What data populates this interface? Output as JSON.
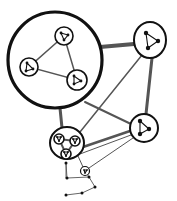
{
  "diagram": {
    "colors": {
      "ink": "#111111",
      "edge": "#555555",
      "background": "#ffffff"
    },
    "clusters": [
      {
        "id": "A",
        "label": "large-cluster",
        "cx": 55,
        "cy": 60,
        "rx": 47,
        "ry": 48,
        "stroke": 3.2,
        "children": [
          {
            "id": "A1",
            "cx": 64,
            "cy": 36,
            "r": 9
          },
          {
            "id": "A2",
            "cx": 29,
            "cy": 67,
            "r": 9
          },
          {
            "id": "A3",
            "cx": 77,
            "cy": 80,
            "r": 10
          }
        ]
      },
      {
        "id": "B",
        "label": "top-right-node",
        "cx": 150,
        "cy": 40,
        "rx": 16,
        "ry": 18,
        "stroke": 2
      },
      {
        "id": "C",
        "label": "right-node",
        "cx": 144,
        "cy": 128,
        "rx": 14,
        "ry": 14,
        "stroke": 2
      },
      {
        "id": "D",
        "label": "bottom-cluster",
        "cx": 67,
        "cy": 143,
        "rx": 17,
        "ry": 16,
        "stroke": 2,
        "children": [
          {
            "id": "D1",
            "cx": 59,
            "cy": 139,
            "r": 5
          },
          {
            "id": "D2",
            "cx": 75,
            "cy": 141,
            "r": 5
          },
          {
            "id": "D3",
            "cx": 66,
            "cy": 154,
            "r": 5
          }
        ]
      },
      {
        "id": "E",
        "label": "small-node",
        "cx": 85,
        "cy": 171,
        "rx": 4.5,
        "ry": 4.5,
        "stroke": 1.2
      }
    ],
    "edges": [
      {
        "from": "A",
        "to": "B",
        "x1": 100,
        "y1": 47,
        "x2": 134,
        "y2": 44,
        "width": 4
      },
      {
        "from": "A",
        "to": "C",
        "x1": 85,
        "y1": 102,
        "x2": 131,
        "y2": 124,
        "width": 2
      },
      {
        "from": "A",
        "to": "D",
        "x1": 60,
        "y1": 108,
        "x2": 62,
        "y2": 128,
        "width": 3
      },
      {
        "from": "B",
        "to": "C",
        "x1": 152,
        "y1": 58,
        "x2": 146,
        "y2": 114,
        "width": 3
      },
      {
        "from": "B",
        "to": "D",
        "x1": 142,
        "y1": 55,
        "x2": 80,
        "y2": 132,
        "width": 1.5
      },
      {
        "from": "C",
        "to": "D",
        "x1": 130,
        "y1": 131,
        "x2": 83,
        "y2": 147,
        "width": 2.5
      },
      {
        "from": "C",
        "to": "D",
        "x1": 131,
        "y1": 135,
        "x2": 80,
        "y2": 154,
        "width": 1
      },
      {
        "from": "C",
        "to": "E",
        "x1": 133,
        "y1": 138,
        "x2": 89,
        "y2": 168,
        "width": 1
      },
      {
        "from": "D",
        "to": "E",
        "x1": 78,
        "y1": 156,
        "x2": 83,
        "y2": 167,
        "width": 1
      }
    ],
    "polygon": {
      "points": [
        [
          66,
          163
        ],
        [
          67,
          178
        ],
        [
          89,
          177
        ],
        [
          95,
          187
        ],
        [
          82,
          193
        ],
        [
          66,
          195
        ]
      ],
      "extra_edges": [
        [
          [
            85,
            171
          ],
          [
            89,
            177
          ]
        ],
        [
          [
            66,
            178
          ],
          [
            66,
            163
          ]
        ]
      ]
    },
    "inner_motifs": {
      "A1": [
        [
          61,
          33
        ],
        [
          68,
          35
        ],
        [
          64,
          40
        ]
      ],
      "A2": [
        [
          27,
          63
        ],
        [
          26,
          71
        ],
        [
          33,
          69
        ]
      ],
      "A3": [
        [
          74,
          76
        ],
        [
          74,
          84
        ],
        [
          81,
          81
        ]
      ],
      "B": [
        [
          146,
          33
        ],
        [
          158,
          41
        ],
        [
          148,
          48
        ]
      ],
      "C": [
        [
          140,
          121
        ],
        [
          140,
          134
        ],
        [
          149,
          129
        ]
      ],
      "D1": [
        [
          57,
          137
        ],
        [
          61,
          137
        ],
        [
          59,
          141
        ]
      ],
      "D2": [
        [
          73,
          139
        ],
        [
          77,
          139
        ],
        [
          75,
          143
        ]
      ],
      "D3": [
        [
          64,
          152
        ],
        [
          68,
          152
        ],
        [
          66,
          156
        ]
      ],
      "E": [
        [
          84,
          170
        ],
        [
          87,
          170
        ],
        [
          85,
          173
        ]
      ]
    }
  }
}
